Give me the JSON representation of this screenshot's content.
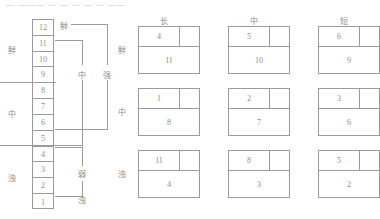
{
  "header": {
    "strip_text": "— ———  — — — —  — ——"
  },
  "ladder": {
    "name": "twelve-step-scale",
    "steps": [
      "12",
      "11",
      "10",
      "9",
      "8",
      "7",
      "6",
      "5",
      "4",
      "3",
      "2",
      "1"
    ]
  },
  "side_labels": {
    "top": "鲜",
    "middle": "中",
    "bottom": "浊"
  },
  "bracket_labels": {
    "xian": "鲜",
    "zhong": "中",
    "qiang": "强",
    "ruo": "弱",
    "zhuo": "浊"
  },
  "grid": {
    "column_headers": [
      "长",
      "中",
      "短"
    ],
    "row_headers": [
      "鲜",
      "中",
      "浊"
    ],
    "cells": [
      [
        {
          "top": "4",
          "bottom": "11"
        },
        {
          "top": "5",
          "bottom": "10"
        },
        {
          "top": "6",
          "bottom": "9"
        }
      ],
      [
        {
          "top": "1",
          "bottom": "8"
        },
        {
          "top": "2",
          "bottom": "7"
        },
        {
          "top": "3",
          "bottom": "6"
        }
      ],
      [
        {
          "top": "11",
          "bottom": "4"
        },
        {
          "top": "8",
          "bottom": "3"
        },
        {
          "top": "5",
          "bottom": "2"
        }
      ]
    ]
  },
  "colors": {
    "line": "#9b9b9b",
    "text": "#8d8d8d",
    "background": "#ffffff"
  }
}
